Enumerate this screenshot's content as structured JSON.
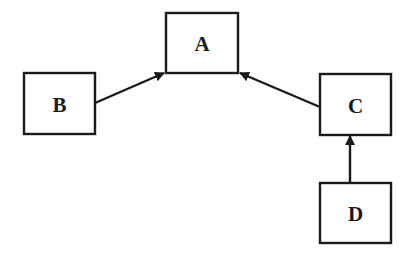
{
  "diagram": {
    "type": "directed-graph",
    "nodes": [
      {
        "id": "A",
        "label": "A",
        "x": 166,
        "y": 13,
        "w": 72,
        "h": 60
      },
      {
        "id": "B",
        "label": "B",
        "x": 24,
        "y": 73,
        "w": 71,
        "h": 61
      },
      {
        "id": "C",
        "label": "C",
        "x": 320,
        "y": 74,
        "w": 71,
        "h": 61
      },
      {
        "id": "D",
        "label": "D",
        "x": 320,
        "y": 183,
        "w": 71,
        "h": 60
      }
    ],
    "edges": [
      {
        "from": "B",
        "to": "A",
        "x1": 95,
        "y1": 103,
        "x2": 164,
        "y2": 73
      },
      {
        "from": "C",
        "to": "A",
        "x1": 320,
        "y1": 107,
        "x2": 240,
        "y2": 73
      },
      {
        "from": "D",
        "to": "C",
        "x1": 350,
        "y1": 183,
        "x2": 350,
        "y2": 136
      }
    ],
    "colors": {
      "stroke": "#1a1a1a",
      "background": "#ffffff"
    }
  }
}
